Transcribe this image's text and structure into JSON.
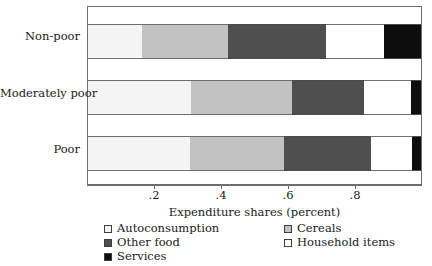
{
  "chart_data": {
    "type": "bar",
    "orientation": "horizontal",
    "stacked": true,
    "normalized": true,
    "title": "",
    "xlabel": "Expenditure shares (percent)",
    "ylabel": "",
    "xlim": [
      0,
      1
    ],
    "xticks": [
      0.2,
      0.4,
      0.6,
      0.8
    ],
    "xticklabels": [
      ".2",
      ".4",
      ".6",
      ".8"
    ],
    "grid": false,
    "legend_position": "bottom",
    "categories": [
      "Non-poor",
      "Moderately poor",
      "Poor"
    ],
    "series": [
      {
        "name": "Autoconsumption",
        "color": "#f4f4f4",
        "values": [
          0.162,
          0.308,
          0.305
        ]
      },
      {
        "name": "Cereals",
        "color": "#c2c2c2",
        "values": [
          0.259,
          0.305,
          0.284
        ]
      },
      {
        "name": "Other food",
        "color": "#4f4f4f",
        "values": [
          0.293,
          0.217,
          0.26
        ]
      },
      {
        "name": "Household items",
        "color": "#ffffff",
        "values": [
          0.176,
          0.14,
          0.125
        ]
      },
      {
        "name": "Services",
        "color": "#0d0d0d",
        "values": [
          0.11,
          0.03,
          0.026
        ]
      }
    ],
    "cumulative_boundaries": {
      "Non-poor": [
        0.162,
        0.421,
        0.714,
        0.89,
        1.0
      ],
      "Moderately poor": [
        0.308,
        0.613,
        0.83,
        0.97,
        1.0
      ],
      "Poor": [
        0.305,
        0.589,
        0.849,
        0.974,
        1.0
      ]
    }
  },
  "axis": {
    "x_title": "Expenditure shares (percent)",
    "x_ticks": [
      {
        "label": ".2",
        "value": 0.2
      },
      {
        "label": ".4",
        "value": 0.4
      },
      {
        "label": ".6",
        "value": 0.6
      },
      {
        "label": ".8",
        "value": 0.8
      }
    ],
    "y_ticks": [
      {
        "label": "Non-poor"
      },
      {
        "label": "Moderately poor"
      },
      {
        "label": "Poor"
      }
    ]
  },
  "legend": {
    "left_column": [
      {
        "label": "Autoconsumption",
        "color": "#f4f4f4"
      },
      {
        "label": "Other food",
        "color": "#4f4f4f"
      },
      {
        "label": "Services",
        "color": "#0d0d0d"
      }
    ],
    "right_column": [
      {
        "label": "Cereals",
        "color": "#c2c2c2"
      },
      {
        "label": "Household items",
        "color": "#ffffff"
      }
    ]
  }
}
